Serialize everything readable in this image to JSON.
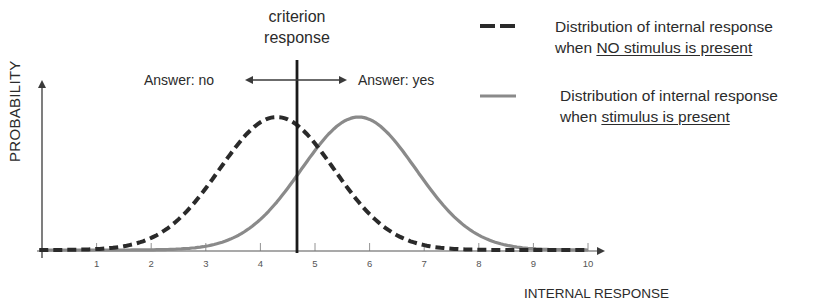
{
  "chart_data": {
    "type": "line",
    "title": "",
    "xlabel": "INTERNAL RESPONSE",
    "ylabel": "PROBABILITY",
    "x_ticks": [
      "1",
      "2",
      "3",
      "4",
      "5",
      "6",
      "7",
      "8",
      "9",
      "10"
    ],
    "xlim": [
      0,
      10
    ],
    "grid": false,
    "criterion": {
      "label_line1": "criterion",
      "label_line2": "response",
      "x": 4.7
    },
    "annotations": {
      "left": "Answer: no",
      "right": "Answer: yes"
    },
    "series": [
      {
        "name": "Distribution of internal response when NO stimulus is present",
        "style": "dashed",
        "color": "#2a2a2a",
        "mean": 4.3,
        "sd": 1.05
      },
      {
        "name": "Distribution of internal response when stimulus is present",
        "style": "solid",
        "color": "#8a8a8a",
        "mean": 5.8,
        "sd": 1.05
      }
    ],
    "legend_position": "top-right"
  },
  "labels": {
    "criterion_line1": "criterion",
    "criterion_line2": "response",
    "answer_no": "Answer: no",
    "answer_yes": "Answer: yes",
    "ylabel": "PROBABILITY",
    "xlabel": "INTERNAL RESPONSE"
  },
  "legend": [
    {
      "line1": "Distribution of internal response",
      "line2_prefix": "when ",
      "line2_underlined": "NO stimulus is present"
    },
    {
      "line1": "Distribution of internal response",
      "line2_prefix": "when ",
      "line2_underlined": "stimulus is present"
    }
  ],
  "ticks": [
    "1",
    "2",
    "3",
    "4",
    "5",
    "6",
    "7",
    "8",
    "9",
    "10"
  ]
}
